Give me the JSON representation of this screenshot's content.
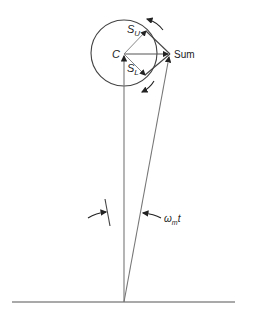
{
  "diagram": {
    "labels": {
      "center": "C",
      "upper_vector": "S",
      "upper_sub": "U",
      "lower_vector": "S",
      "lower_sub": "L",
      "sum": "Sum",
      "angle_omega": "ω",
      "angle_sub": "m",
      "angle_t": "t"
    },
    "colors": {
      "stroke": "#555555",
      "text": "#222222",
      "background": "#ffffff"
    }
  }
}
